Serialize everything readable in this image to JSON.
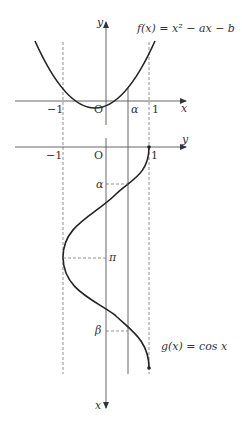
{
  "header": {
    "cut_text": "는 그림과 같이 주어진다"
  },
  "top_graph": {
    "function_label": "f(x) = x² − ax − b",
    "x_axis_label": "x",
    "y_axis_label": "y",
    "ticks": {
      "neg_one": "−1",
      "origin": "O",
      "alpha": "α",
      "one": "1"
    }
  },
  "bottom_graph": {
    "function_label": "g(x) = cos x",
    "x_axis_label": "x",
    "y_axis_label": "y",
    "ticks": {
      "neg_one": "−1",
      "origin": "O",
      "one": "1",
      "alpha": "α",
      "pi": "π",
      "beta": "β"
    }
  },
  "colors": {
    "curve": "#222222",
    "axis": "#555555",
    "dashed": "#777777"
  }
}
